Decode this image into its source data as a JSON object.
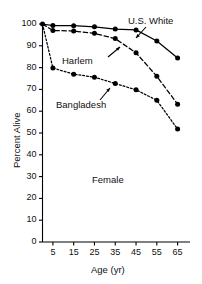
{
  "chart_data": {
    "type": "line",
    "title": "",
    "xlabel": "Age (yr)",
    "ylabel": "Percent Alive",
    "xlim": [
      0,
      70
    ],
    "ylim": [
      0,
      100
    ],
    "x": [
      0,
      5,
      15,
      25,
      35,
      45,
      55,
      65
    ],
    "xticks": [
      5,
      15,
      25,
      35,
      45,
      55,
      65
    ],
    "yticks": [
      0,
      10,
      20,
      30,
      40,
      50,
      60,
      70,
      80,
      90,
      100
    ],
    "grid": false,
    "legend": "inline-annotations",
    "annotations": [
      {
        "name": "group-annotation",
        "text": "Female"
      },
      {
        "name": "series-annotation",
        "text": "U.S. White"
      },
      {
        "name": "series-annotation",
        "text": "Harlem"
      },
      {
        "name": "series-annotation",
        "text": "Bangladesh"
      }
    ],
    "series": [
      {
        "name": "U.S. White",
        "style": "solid",
        "marker": "filled-circle",
        "color": "#000000",
        "values": [
          100,
          99.3,
          99.2,
          98.7,
          97.7,
          97.3,
          92.2,
          84.4
        ]
      },
      {
        "name": "Harlem",
        "style": "dashed",
        "marker": "filled-circle",
        "color": "#000000",
        "values": [
          100,
          97.0,
          96.8,
          95.7,
          93.3,
          86.8,
          76.0,
          63.2
        ]
      },
      {
        "name": "Bangladesh",
        "style": "dotted",
        "marker": "filled-circle",
        "color": "#000000",
        "values": [
          100,
          79.8,
          77.0,
          75.6,
          72.7,
          69.8,
          65.0,
          51.8
        ]
      }
    ]
  },
  "yticklabels": [
    "100",
    "90",
    "80",
    "70",
    "60",
    "50",
    "40",
    "30",
    "20",
    "10",
    "0"
  ],
  "xticklabels": [
    "5",
    "15",
    "25",
    "35",
    "45",
    "55",
    "65"
  ],
  "axis": {
    "y_title": "Percent Alive",
    "x_title": "Age (yr)"
  },
  "labels": {
    "us_white": "U.S. White",
    "harlem": "Harlem",
    "bangladesh": "Bangladesh",
    "female": "Female"
  }
}
